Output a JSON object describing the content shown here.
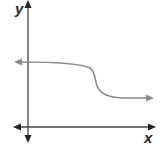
{
  "graph": {
    "x_axis_label": "x",
    "y_axis_label": "y",
    "axis_color": "#333333",
    "curve_color": "#8a8a8a",
    "description": "Decreasing curve with horizontal asymptotes on both ends; high on left, steep drop in middle, low on right",
    "curve": {
      "left_arrow": true,
      "right_arrow": true,
      "shape": "reverse-sigmoid"
    }
  }
}
